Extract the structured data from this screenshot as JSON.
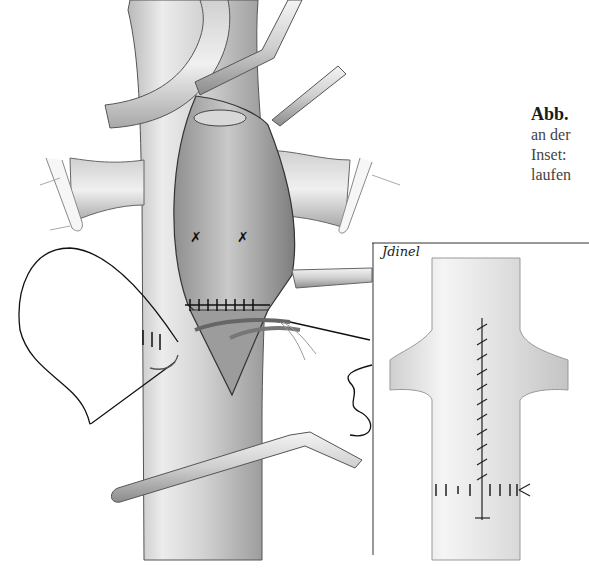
{
  "caption": {
    "figure_label": "Abb.",
    "lines": [
      "an der",
      "Inset: ",
      "laufen"
    ]
  },
  "illustration": {
    "description": "Surgical illustration of a vessel with incision, sutures and clamps",
    "signature": "Jdinel",
    "inset": {
      "description": "Detail view of vessel with longitudinal running suture and transverse sutures"
    }
  },
  "colors": {
    "ink": "#1a1a1a",
    "shade": "#8a8a8a",
    "light": "#e6e6e6",
    "paper": "#ffffff"
  }
}
